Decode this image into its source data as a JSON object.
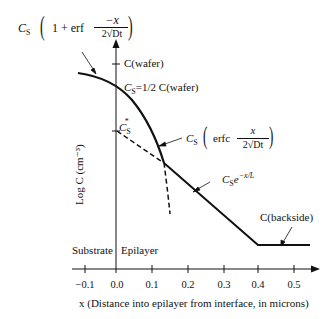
{
  "figure": {
    "y_axis_label": "Log C (cm⁻³)",
    "x_axis_label": "x  (Distance into epilayer  from interface, in microns)",
    "x_ticks": [
      "−0.1",
      "0.0",
      "0.1",
      "0.2",
      "0.3",
      "0.4",
      "0.5"
    ],
    "regions": {
      "left": "Substrate",
      "right": "Epilayer"
    },
    "annotations": {
      "top_curve": "C_S (1 + erf (−x / 2√Dt))",
      "c_wafer": "C(wafer)",
      "cs_half": "C_S = 1/2  C(wafer)",
      "cs_star": "C_S*",
      "erfc_curve": "C_S (erfc (x / 2√Dt))",
      "exp_curve": "C_S* e^(−x/L)",
      "backside": "C(backside)"
    }
  },
  "labels": {
    "cs": "C",
    "cs_sub": "S",
    "one_plus_erf": "1 + erf",
    "minus_x": "−x",
    "two_sqrt": "2√Dt",
    "c_wafer": "C(wafer)",
    "cs_half_eq": "=1/2  C(wafer)",
    "erfc": "erfc",
    "x": "x",
    "exp": "−x/L",
    "backside": "C(backside)",
    "substrate": "Substrate",
    "epilayer": "Epilayer",
    "ylabel": "Log C (cm⁻³)",
    "xlabel": "x  (Distance into epilayer  from interface, in microns)",
    "tick0": "−0.1",
    "tick1": "0.0",
    "tick2": "0.1",
    "tick3": "0.2",
    "tick4": "0.3",
    "tick5": "0.4",
    "tick6": "0.5"
  }
}
